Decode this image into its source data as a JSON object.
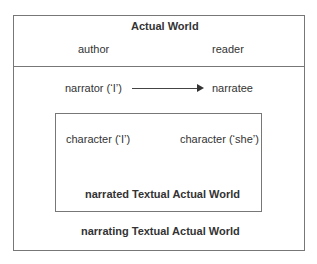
{
  "diagram": {
    "actual_world": {
      "title": "Actual World",
      "left": "author",
      "right": "reader"
    },
    "narrating": {
      "left": "narrator (‘I’)",
      "right": "narratee",
      "label": "narrating Textual Actual World"
    },
    "narrated": {
      "left": "character (‘I’)",
      "right": "character (‘she’)",
      "label": "narrated Textual Actual World"
    },
    "arrow": "right-arrow"
  }
}
